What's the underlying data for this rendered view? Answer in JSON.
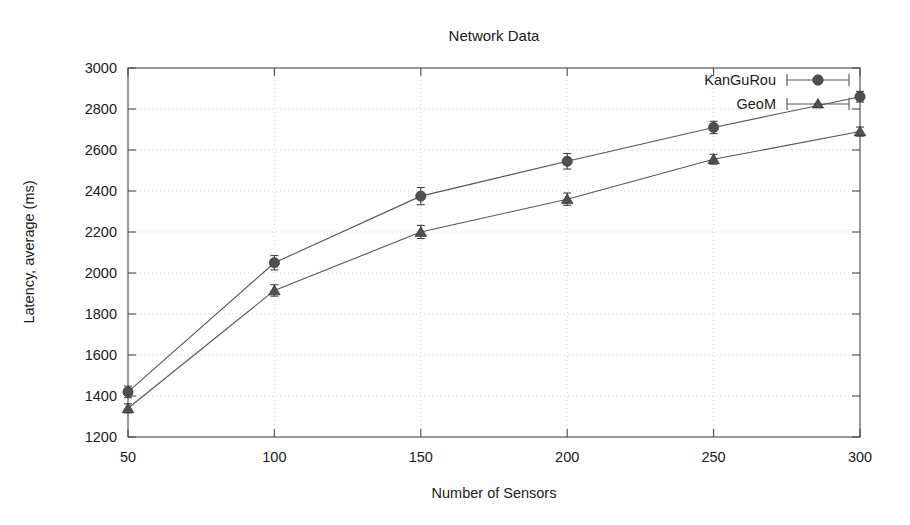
{
  "chart_data": {
    "type": "line",
    "title": "Network Data",
    "xlabel": "Number of Sensors",
    "ylabel": "Latency, average (ms)",
    "x": [
      50,
      100,
      150,
      200,
      250,
      300
    ],
    "xticklabels": [
      "50",
      "100",
      "150",
      "200",
      "250",
      "300"
    ],
    "yticklabels": [
      "1200",
      "1400",
      "1600",
      "1800",
      "2000",
      "2200",
      "2400",
      "2600",
      "2800",
      "3000"
    ],
    "yticks": [
      1200,
      1400,
      1600,
      1800,
      2000,
      2200,
      2400,
      2600,
      2800,
      3000
    ],
    "xlim": [
      50,
      300
    ],
    "ylim": [
      1200,
      3000
    ],
    "grid": true,
    "legend_position": "top-right",
    "series": [
      {
        "name": "KanGuRou",
        "marker": "filled-circle",
        "values": [
          1420,
          2050,
          2375,
          2545,
          2710,
          2860
        ],
        "errors": [
          28,
          35,
          42,
          38,
          30,
          26
        ]
      },
      {
        "name": "GeoM",
        "marker": "filled-triangle",
        "values": [
          1340,
          1915,
          2200,
          2360,
          2555,
          2690
        ],
        "errors": [
          22,
          28,
          32,
          30,
          24,
          22
        ]
      }
    ]
  },
  "figure": {
    "title": "Network Data",
    "x_axis_label": "Number of Sensors",
    "y_axis_label": "Latency, average (ms)"
  },
  "legend": {
    "entries": [
      {
        "label": "KanGuRou"
      },
      {
        "label": "GeoM"
      }
    ]
  },
  "axes": {
    "y_tick_labels": [
      "3000",
      "2800",
      "2600",
      "2400",
      "2200",
      "2000",
      "1800",
      "1600",
      "1400",
      "1200"
    ],
    "x_tick_labels": [
      "50",
      "100",
      "150",
      "200",
      "250",
      "300"
    ]
  },
  "colors": {
    "series_line": "#555555",
    "marker_fill": "#4f4f4f",
    "frame": "#4a4a4a",
    "grid": "#c9c9c9",
    "text": "#1a1a1a",
    "background": "#ffffff"
  }
}
